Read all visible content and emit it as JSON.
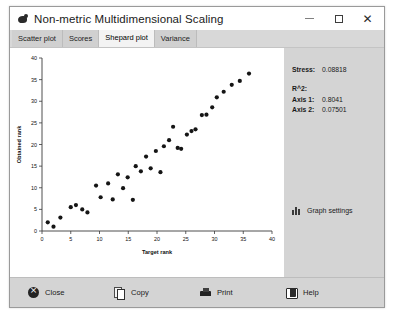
{
  "window": {
    "title": "Non-metric Multidimensional Scaling",
    "icon": "orange-app-icon",
    "controls": {
      "minimize": "–",
      "maximize": "□",
      "close": "✕"
    }
  },
  "tabs": [
    {
      "label": "Scatter plot",
      "active": false
    },
    {
      "label": "Scores",
      "active": false
    },
    {
      "label": "Shepard plot",
      "active": true
    },
    {
      "label": "Variance",
      "active": false
    }
  ],
  "side_panel": {
    "stress_label": "Stress:",
    "stress_value": "0.08818",
    "r2_heading": "R^2:",
    "axis1_label": "Axis 1:",
    "axis1_value": "0.8041",
    "axis2_label": "Axis 2:",
    "axis2_value": "0.07501",
    "graph_settings_label": "Graph settings",
    "graph_settings_icon": "bar-chart-icon"
  },
  "toolbar": {
    "buttons": [
      {
        "label": "Close",
        "icon": "close-circle-icon"
      },
      {
        "label": "Copy",
        "icon": "copy-pages-icon"
      },
      {
        "label": "Print",
        "icon": "printer-icon"
      },
      {
        "label": "Help",
        "icon": "book-icon"
      }
    ]
  },
  "chart_data": {
    "type": "scatter",
    "title": "",
    "xlabel": "Target rank",
    "ylabel": "Obtained rank",
    "xlim": [
      0,
      40
    ],
    "ylim": [
      0,
      40
    ],
    "xticks": [
      0,
      5,
      10,
      15,
      20,
      25,
      30,
      35,
      40
    ],
    "yticks": [
      0,
      5,
      10,
      15,
      20,
      25,
      30,
      35,
      40
    ],
    "grid": false,
    "legend": null,
    "marker": "circle",
    "marker_color": "#151515",
    "marker_size": 2.1,
    "points": [
      [
        1.0,
        2.0
      ],
      [
        2.0,
        1.0
      ],
      [
        3.2,
        3.1
      ],
      [
        5.0,
        5.5
      ],
      [
        5.9,
        6.0
      ],
      [
        7.0,
        5.0
      ],
      [
        7.9,
        4.3
      ],
      [
        9.4,
        10.5
      ],
      [
        10.2,
        7.8
      ],
      [
        11.5,
        11.0
      ],
      [
        12.3,
        7.3
      ],
      [
        13.2,
        13.1
      ],
      [
        14.1,
        9.9
      ],
      [
        14.9,
        12.4
      ],
      [
        15.8,
        7.2
      ],
      [
        16.3,
        15.0
      ],
      [
        17.2,
        13.8
      ],
      [
        18.1,
        17.2
      ],
      [
        18.9,
        14.5
      ],
      [
        19.8,
        18.5
      ],
      [
        20.6,
        13.6
      ],
      [
        21.2,
        19.6
      ],
      [
        22.1,
        21.0
      ],
      [
        22.8,
        24.1
      ],
      [
        23.6,
        19.2
      ],
      [
        24.2,
        19.0
      ],
      [
        25.2,
        22.3
      ],
      [
        26.0,
        23.1
      ],
      [
        26.7,
        23.5
      ],
      [
        27.8,
        26.8
      ],
      [
        28.6,
        26.9
      ],
      [
        29.6,
        28.6
      ],
      [
        30.4,
        30.9
      ],
      [
        31.6,
        32.2
      ],
      [
        33.0,
        33.8
      ],
      [
        34.4,
        34.7
      ],
      [
        36.0,
        36.4
      ]
    ]
  }
}
